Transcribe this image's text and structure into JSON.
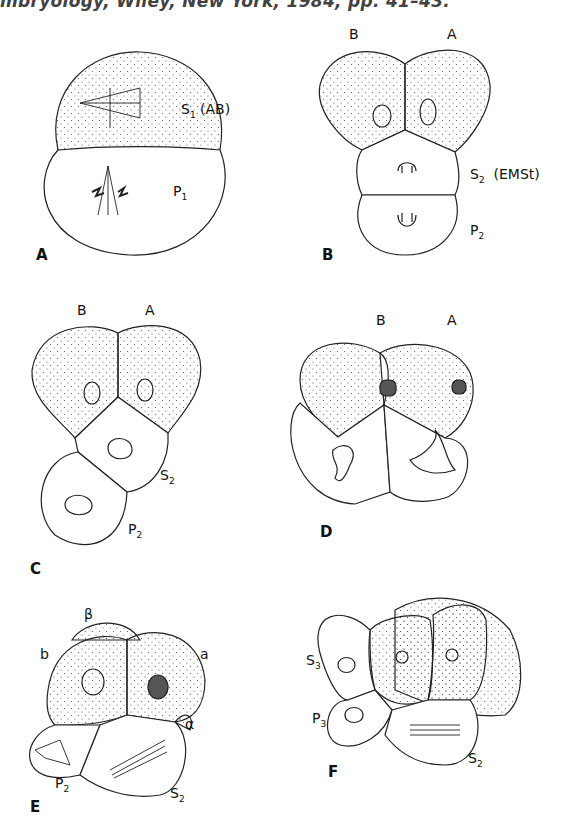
{
  "caption": {
    "text": "mbryology, Wiley, New York, 1984, pp. 41–43."
  },
  "panels": [
    {
      "id": "A",
      "label": "A",
      "cells": [
        {
          "name": "S",
          "sub": "1",
          "extra": " (AB)"
        },
        {
          "name": "P",
          "sub": "1",
          "extra": ""
        }
      ]
    },
    {
      "id": "B",
      "label": "B",
      "top_labels": [
        "B",
        "A"
      ],
      "cells": [
        {
          "name": "S",
          "sub": "2",
          "extra": "  (EMSt)"
        },
        {
          "name": "P",
          "sub": "2",
          "extra": ""
        }
      ]
    },
    {
      "id": "C",
      "label": "C",
      "top_labels": [
        "B",
        "A"
      ],
      "cells": [
        {
          "name": "S",
          "sub": "2",
          "extra": ""
        },
        {
          "name": "P",
          "sub": "2",
          "extra": ""
        }
      ]
    },
    {
      "id": "D",
      "label": "D",
      "top_labels": [
        "B",
        "A"
      ],
      "cells": []
    },
    {
      "id": "E",
      "label": "E",
      "top_labels": [
        "β",
        "b",
        "a",
        "α"
      ],
      "cells": [
        {
          "name": "P",
          "sub": "2",
          "extra": ""
        },
        {
          "name": "S",
          "sub": "2",
          "extra": ""
        }
      ]
    },
    {
      "id": "F",
      "label": "F",
      "cells": [
        {
          "name": "S",
          "sub": "3",
          "extra": ""
        },
        {
          "name": "P",
          "sub": "3",
          "extra": ""
        },
        {
          "name": "S",
          "sub": "2",
          "extra": ""
        }
      ]
    }
  ]
}
